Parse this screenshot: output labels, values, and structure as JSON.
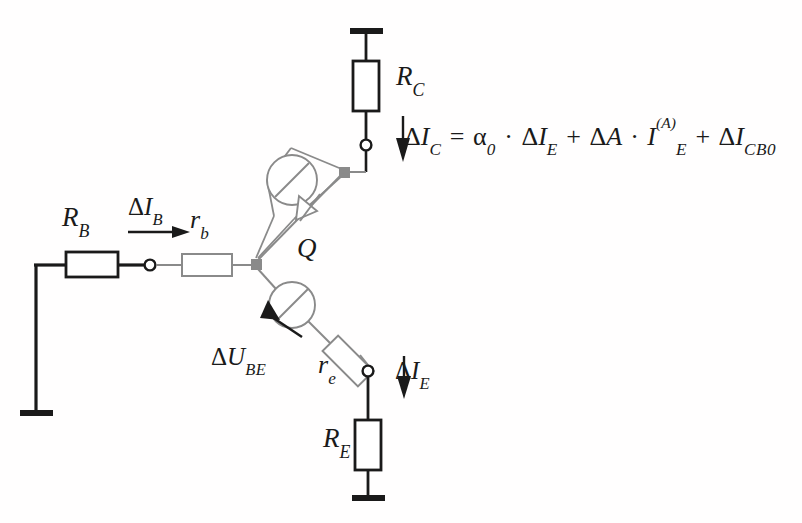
{
  "diagram": {
    "type": "circuit-schematic",
    "background_color": "#fffefe",
    "ink_color": "#1a1a1a",
    "gray_color": "#8a8a8a"
  },
  "labels": {
    "r_base_external": {
      "symbol": "R",
      "subscript": "B"
    },
    "r_base_internal": {
      "symbol": "r",
      "subscript": "b"
    },
    "r_collector": {
      "symbol": "R",
      "subscript": "C"
    },
    "r_emitter_internal": {
      "symbol": "r",
      "subscript": "e"
    },
    "r_emitter_external": {
      "symbol": "R",
      "subscript": "E"
    },
    "transistor": {
      "symbol": "Q"
    },
    "delta_ib": {
      "delta": "Δ",
      "symbol": "I",
      "subscript": "B"
    },
    "delta_ic": {
      "delta": "Δ",
      "symbol": "I",
      "subscript": "C"
    },
    "delta_ie": {
      "delta": "Δ",
      "symbol": "I",
      "subscript": "E"
    },
    "delta_ube": {
      "delta": "Δ",
      "symbol": "U",
      "subscript": "BE"
    }
  },
  "equation": {
    "lhs": {
      "delta": "Δ",
      "symbol": "I",
      "subscript": "C"
    },
    "equals": "=",
    "term1": {
      "coefficient": "α",
      "coefficient_sub": "0",
      "dot": "·",
      "delta": "Δ",
      "symbol": "I",
      "subscript": "E"
    },
    "plus1": "+",
    "term2": {
      "delta": "Δ",
      "symbol": "A",
      "dot": "·",
      "current_symbol": "I",
      "current_sub": "E",
      "current_sup": "(A)"
    },
    "plus2": "+",
    "term3": {
      "delta": "Δ",
      "symbol": "I",
      "subscript": "CB0"
    },
    "plain_text": "ΔI_C = α₀ · ΔI_E + ΔA · I_E^(A) + ΔI_CB0"
  },
  "components": {
    "current_source": "current-source-symbol",
    "diode": "diode-symbol",
    "voltage_source": "voltage-source-symbol",
    "ground_top": "ground-symbol",
    "ground_left": "ground-symbol",
    "ground_bottom": "ground-symbol",
    "node_base": "junction-node",
    "node_collector": "junction-node",
    "terminal_base": "open-terminal",
    "terminal_collector": "open-terminal",
    "terminal_emitter": "open-terminal"
  }
}
